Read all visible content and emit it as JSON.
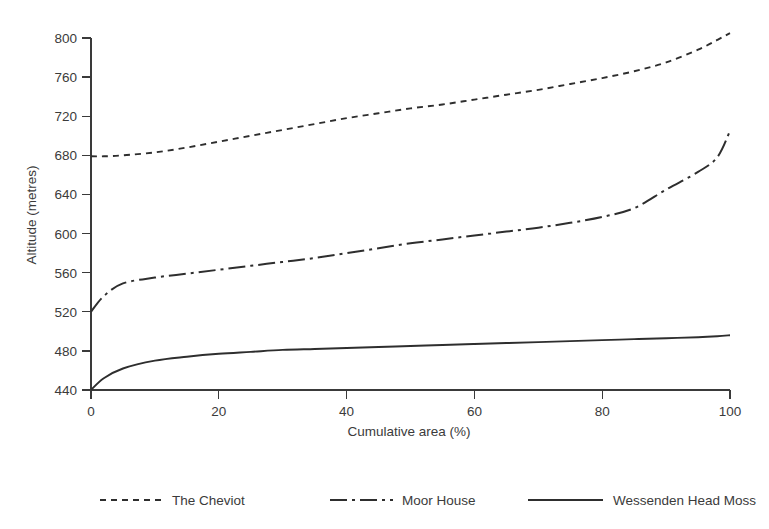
{
  "chart_data": {
    "type": "line",
    "title": "",
    "xlabel": "Cumulative area (%)",
    "ylabel": "Altitude (metres)",
    "xlim": [
      0,
      100
    ],
    "ylim": [
      440,
      800
    ],
    "xticks": [
      0,
      20,
      40,
      60,
      80,
      100
    ],
    "yticks": [
      440,
      480,
      520,
      560,
      600,
      640,
      680,
      720,
      760,
      800
    ],
    "xticklabels": [
      "0",
      "20",
      "40",
      "60",
      "80",
      "100"
    ],
    "yticklabels": [
      "440",
      "480",
      "520",
      "560",
      "600",
      "640",
      "680",
      "720",
      "760",
      "800"
    ],
    "grid": false,
    "legend_position": "bottom",
    "x": [
      0,
      2,
      5,
      10,
      15,
      20,
      25,
      30,
      35,
      40,
      45,
      50,
      55,
      60,
      65,
      70,
      75,
      80,
      85,
      90,
      95,
      98,
      100
    ],
    "series": [
      {
        "name": "The Cheviot",
        "linestyle": "dotted",
        "color": "#2e2e2e",
        "values": [
          679,
          679,
          680,
          683,
          688,
          694,
          700,
          706,
          712,
          718,
          723,
          728,
          732,
          737,
          742,
          747,
          753,
          759,
          766,
          775,
          788,
          798,
          805
        ]
      },
      {
        "name": "Moor House",
        "linestyle": "dashdot",
        "color": "#2e2e2e",
        "values": [
          520,
          536,
          549,
          555,
          559,
          563,
          567,
          571,
          575,
          580,
          585,
          590,
          594,
          598,
          602,
          606,
          611,
          617,
          626,
          645,
          663,
          678,
          705
        ]
      },
      {
        "name": "Wessenden Head Moss",
        "linestyle": "solid",
        "color": "#2e2e2e",
        "values": [
          440,
          452,
          462,
          470,
          474,
          477,
          479,
          481,
          482,
          483,
          484,
          485,
          486,
          487,
          488,
          489,
          490,
          491,
          492,
          493,
          494,
          495,
          496
        ]
      }
    ],
    "legend": [
      {
        "label": "The Cheviot",
        "linestyle": "dotted"
      },
      {
        "label": "Moor House",
        "linestyle": "dashdot"
      },
      {
        "label": "Wessenden Head Moss",
        "linestyle": "solid"
      }
    ],
    "colors": {
      "axis": "#3a3a3a",
      "text": "#3b3b3b",
      "series": "#2e2e2e",
      "background": "#ffffff"
    }
  }
}
